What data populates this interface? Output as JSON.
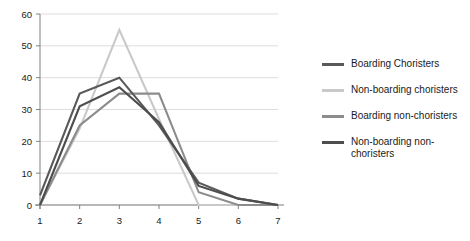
{
  "chart_data": {
    "type": "line",
    "title": "",
    "xlabel": "",
    "ylabel": "",
    "categories": [
      "1",
      "2",
      "3",
      "4",
      "5",
      "6",
      "7"
    ],
    "x": [
      1,
      2,
      3,
      4,
      5,
      6,
      7
    ],
    "ylim": [
      0,
      60
    ],
    "y_ticks": [
      0,
      10,
      20,
      30,
      40,
      50,
      60
    ],
    "y_tick_labels": [
      "0",
      "10",
      "20",
      "30",
      "40",
      "50",
      "60"
    ],
    "x_tick_labels": [
      "1",
      "2",
      "3",
      "4",
      "5",
      "6",
      "7"
    ],
    "grid": "horizontal",
    "legend_position": "right",
    "series": [
      {
        "name": "Boarding Choristers",
        "color": "#595959",
        "values": [
          3,
          35,
          40,
          25,
          7,
          2,
          0
        ]
      },
      {
        "name": "Non-boarding choristers",
        "color": "#c9c9c9",
        "values": [
          0,
          24,
          55,
          27,
          0,
          0,
          0
        ]
      },
      {
        "name": "Boarding non-choristers",
        "color": "#8c8c8c",
        "values": [
          0,
          25,
          35,
          35,
          4,
          0,
          0
        ]
      },
      {
        "name": "Non-boarding non-choristers",
        "color": "#4d4d4d",
        "values": [
          0,
          31,
          37,
          26,
          6,
          2,
          0
        ]
      }
    ]
  },
  "legend": {
    "items": [
      {
        "label": "Boarding Choristers",
        "color": "#595959"
      },
      {
        "label": "Non-boarding choristers",
        "color": "#c9c9c9"
      },
      {
        "label": "Boarding non-choristers",
        "color": "#8c8c8c"
      },
      {
        "label": "Non-boarding non-\nchoristers",
        "color": "#4d4d4d"
      }
    ]
  },
  "axes": {
    "grid_color": "#d4d4d4",
    "axis_color": "#808080",
    "text_color": "#1a1a1a"
  }
}
